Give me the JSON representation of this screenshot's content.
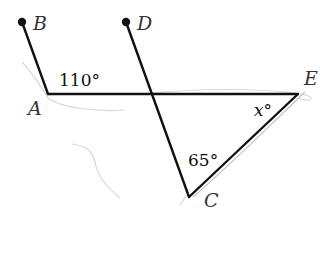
{
  "diagram": {
    "type": "geometry",
    "points": {
      "A": {
        "label": "A",
        "x": 48,
        "y": 94
      },
      "B": {
        "label": "B",
        "x": 22,
        "y": 22
      },
      "C": {
        "label": "C",
        "x": 189,
        "y": 197
      },
      "D": {
        "label": "D",
        "x": 126,
        "y": 22
      },
      "E": {
        "label": "E",
        "x": 298,
        "y": 94
      }
    },
    "segments": [
      "AB",
      "AE",
      "DC",
      "EC"
    ],
    "angles": {
      "BAE": "110°",
      "ECD": "65°",
      "AEC": "x°"
    },
    "colors": {
      "line": "#111111",
      "label": "#333333",
      "smudge": "#bbbbbb"
    }
  }
}
